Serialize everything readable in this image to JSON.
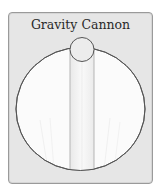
{
  "card": {
    "title": "Gravity Cannon"
  },
  "artwork": {
    "description": "large white circle with a small circle at the top and a vertical tube running down the center",
    "colors": {
      "card_background": "#e6e6e6",
      "card_border": "#9a9a9a",
      "circle_fill": "#fbfbfb",
      "circle_stroke": "#555555",
      "tube_fill": "#f2f2f2",
      "tube_stroke": "#b5b5b5"
    }
  }
}
